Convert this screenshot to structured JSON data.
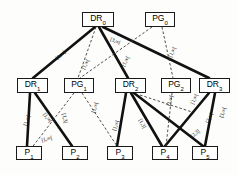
{
  "diagram": {
    "background_color": "#fdfdfb",
    "solid_edge_color": "#111111",
    "dashed_edge_color": "#3a3a3a",
    "node_border_color": "#1a1a1a",
    "node_fill_color": "#ffffff"
  },
  "nodes": [
    {
      "id": "DR0",
      "base": "DR",
      "sub": "0",
      "x": 82,
      "y": 12,
      "w": 32,
      "h": 15
    },
    {
      "id": "PG0",
      "base": "PG",
      "sub": "0",
      "x": 145,
      "y": 12,
      "w": 30,
      "h": 15
    },
    {
      "id": "DR1",
      "base": "DR",
      "sub": "1",
      "x": 17,
      "y": 78,
      "w": 31,
      "h": 15
    },
    {
      "id": "PG1",
      "base": "PG",
      "sub": "1",
      "x": 64,
      "y": 78,
      "w": 30,
      "h": 15
    },
    {
      "id": "DR2",
      "base": "DR",
      "sub": "2",
      "x": 115,
      "y": 78,
      "w": 31,
      "h": 15
    },
    {
      "id": "PG2",
      "base": "PG",
      "sub": "2",
      "x": 161,
      "y": 78,
      "w": 30,
      "h": 15
    },
    {
      "id": "DR3",
      "base": "DR",
      "sub": "3",
      "x": 199,
      "y": 78,
      "w": 31,
      "h": 15
    },
    {
      "id": "P1",
      "base": "P",
      "sub": "1",
      "x": 16,
      "y": 146,
      "w": 26,
      "h": 14
    },
    {
      "id": "P2",
      "base": "P",
      "sub": "2",
      "x": 62,
      "y": 146,
      "w": 26,
      "h": 14
    },
    {
      "id": "P3",
      "base": "P",
      "sub": "3",
      "x": 107,
      "y": 146,
      "w": 26,
      "h": 14
    },
    {
      "id": "P4",
      "base": "P",
      "sub": "4",
      "x": 152,
      "y": 146,
      "w": 26,
      "h": 14
    },
    {
      "id": "P5",
      "base": "P",
      "sub": "5",
      "x": 192,
      "y": 146,
      "w": 26,
      "h": 14
    }
  ],
  "edges": [
    {
      "from": "DR0",
      "to": "DR1",
      "style": "solid",
      "x1": 95,
      "y1": 27,
      "x2": 33,
      "y2": 78
    },
    {
      "from": "DR0",
      "to": "DR2",
      "style": "solid",
      "x1": 99,
      "y1": 27,
      "x2": 128,
      "y2": 78
    },
    {
      "from": "DR0",
      "to": "DR3",
      "style": "solid",
      "x1": 103,
      "y1": 27,
      "x2": 209,
      "y2": 78
    },
    {
      "from": "DR0",
      "to": "PG1",
      "style": "dashed",
      "x1": 96,
      "y1": 27,
      "x2": 78,
      "y2": 78
    },
    {
      "from": "PG0",
      "to": "PG1",
      "style": "dashed",
      "x1": 152,
      "y1": 27,
      "x2": 80,
      "y2": 78
    },
    {
      "from": "PG0",
      "to": "PG2",
      "style": "dashed",
      "x1": 162,
      "y1": 27,
      "x2": 173,
      "y2": 78
    },
    {
      "from": "DR1",
      "to": "P1",
      "style": "solid",
      "x1": 30,
      "y1": 93,
      "x2": 27,
      "y2": 146
    },
    {
      "from": "DR1",
      "to": "P2",
      "style": "solid",
      "x1": 35,
      "y1": 93,
      "x2": 72,
      "y2": 146
    },
    {
      "from": "PG1",
      "to": "P2",
      "style": "dashed",
      "x1": 74,
      "y1": 93,
      "x2": 30,
      "y2": 150
    },
    {
      "from": "PG1",
      "to": "P3",
      "style": "dashed",
      "x1": 82,
      "y1": 93,
      "x2": 117,
      "y2": 146
    },
    {
      "from": "DR2",
      "to": "P3",
      "style": "solid",
      "x1": 126,
      "y1": 93,
      "x2": 117,
      "y2": 146
    },
    {
      "from": "DR2",
      "to": "P4",
      "style": "solid",
      "x1": 131,
      "y1": 93,
      "x2": 162,
      "y2": 146
    },
    {
      "from": "DR2",
      "to": "P5",
      "style": "solid",
      "x1": 134,
      "y1": 93,
      "x2": 203,
      "y2": 146
    },
    {
      "from": "DR2",
      "to": "PG2",
      "style": "dashed",
      "x1": 140,
      "y1": 95,
      "x2": 192,
      "y2": 112
    },
    {
      "from": "PG2",
      "to": "P4",
      "style": "dashed",
      "x1": 172,
      "y1": 93,
      "x2": 166,
      "y2": 146
    },
    {
      "from": "DR3",
      "to": "P4",
      "style": "solid",
      "x1": 209,
      "y1": 93,
      "x2": 165,
      "y2": 146
    },
    {
      "from": "DR3",
      "to": "P5",
      "style": "solid",
      "x1": 215,
      "y1": 93,
      "x2": 205,
      "y2": 146
    }
  ],
  "edge_labels": [
    {
      "text": "[1,∞[",
      "x": 55,
      "y": 57,
      "rot": -40,
      "for": "DR0-DR1"
    },
    {
      "text": "[3,∞[",
      "x": 111,
      "y": 37,
      "rot": 20,
      "for": "DR0-DR3"
    },
    {
      "text": "[1,∞[",
      "x": 81,
      "y": 68,
      "rot": -62,
      "for": "DR0-PG1"
    },
    {
      "text": "[1,∞[",
      "x": 121,
      "y": 65,
      "rot": -62,
      "for": "DR0-DR2"
    },
    {
      "text": "[1,∞[",
      "x": 168,
      "y": 56,
      "rot": -66,
      "for": "PG0-PG2"
    },
    {
      "text": "[1,∞[",
      "x": 23,
      "y": 125,
      "rot": -72,
      "for": "DR1-P1"
    },
    {
      "text": "[1,∞[",
      "x": 46,
      "y": 112,
      "rot": 52,
      "for": "DR1-P2"
    },
    {
      "text": "[1,∞[",
      "x": 41,
      "y": 138,
      "rot": -14,
      "for": "PG1-P2"
    },
    {
      "text": "[1,3]",
      "x": 66,
      "y": 113,
      "rot": 78,
      "for": "PG1-left"
    },
    {
      "text": "[1,∞[",
      "x": 91,
      "y": 112,
      "rot": -72,
      "for": "PG1-P3"
    },
    {
      "text": "[1,∞[",
      "x": 112,
      "y": 130,
      "rot": -72,
      "for": "DR2-P3"
    },
    {
      "text": "[1,3]",
      "x": 142,
      "y": 118,
      "rot": 62,
      "for": "DR2-P4"
    },
    {
      "text": "[1,∞[",
      "x": 166,
      "y": 105,
      "rot": -72,
      "for": "DR2-PG2"
    },
    {
      "text": "[1,∞[",
      "x": 190,
      "y": 103,
      "rot": -66,
      "for": "PG2-P4"
    },
    {
      "text": "[2,∞[",
      "x": 205,
      "y": 122,
      "rot": -66,
      "for": "DR3-P5"
    },
    {
      "text": "[3,∞[",
      "x": 219,
      "y": 117,
      "rot": -72,
      "for": "DR3-right"
    },
    {
      "text": "[2,3]",
      "x": 190,
      "y": 135,
      "rot": -40,
      "for": "DR3-P4"
    }
  ]
}
